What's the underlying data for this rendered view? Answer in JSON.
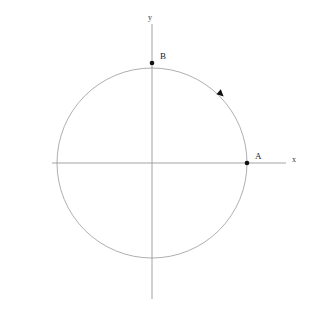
{
  "figure": {
    "title": "",
    "background_color": "#ffffff",
    "width": 310,
    "height": 316
  },
  "axes": {
    "x_axis": {
      "label": "x",
      "label_x": 292,
      "label_y": 156,
      "color": "#9a9a9a",
      "start_x": 52,
      "end_x": 286,
      "y": 163
    },
    "y_axis": {
      "label": "y",
      "label_x": 148,
      "label_y": 14,
      "color": "#9a9a9a",
      "x": 152,
      "start_y": 24,
      "end_y": 299
    }
  },
  "chart_data": {
    "type": "scatter",
    "title": "",
    "xlabel": "x",
    "ylabel": "y",
    "origin": {
      "x": 152,
      "y": 163
    },
    "circle": {
      "center_x": 152,
      "center_y": 163,
      "radius": 95,
      "stroke": "#8d8d8d",
      "stroke_width": 0.7,
      "fill": "none"
    },
    "points": [
      {
        "label": "A",
        "x": 247,
        "y": 163,
        "angle_deg": 0,
        "label_offset_x": 8,
        "label_offset_y": -11,
        "color": "#111111",
        "radius": 2.3
      },
      {
        "label": "B",
        "x": 152,
        "y": 63,
        "angle_deg": 90,
        "label_offset_x": 8,
        "label_offset_y": -11,
        "color": "#111111",
        "radius": 2.3
      }
    ],
    "direction_marker": {
      "label": "",
      "x": 221,
      "y": 94,
      "angle_deg": 46,
      "orientation": "clockwise",
      "color": "#111111",
      "size": 4
    },
    "grid": false,
    "legend": null
  }
}
